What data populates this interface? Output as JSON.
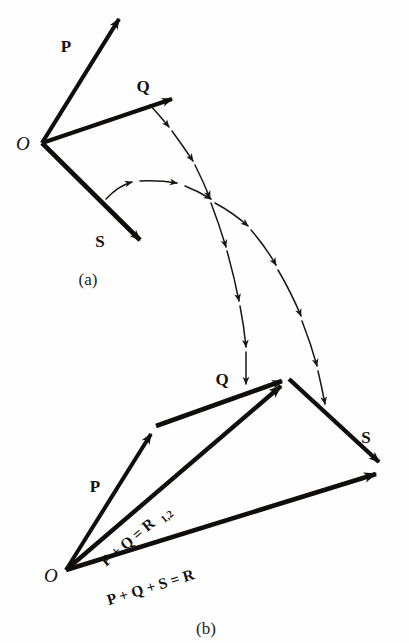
{
  "figure": {
    "background_color": "#fefefe",
    "ink_color": "#100d0c",
    "width": 409,
    "height": 643
  },
  "panels": [
    {
      "id": "a",
      "caption": "(a)",
      "caption_pos": {
        "x": 88,
        "y": 285
      },
      "origin_label": "O",
      "origin_label_pos": {
        "x": 16,
        "y": 150
      },
      "origin_point": {
        "x": 42,
        "y": 143
      },
      "vectors": [
        {
          "name": "P",
          "label": "P",
          "label_pos": {
            "x": 66,
            "y": 52
          },
          "from": {
            "x": 42,
            "y": 143
          },
          "to": {
            "x": 124,
            "y": 12
          },
          "width": 4.2
        },
        {
          "name": "Q",
          "label": "Q",
          "label_pos": {
            "x": 143,
            "y": 92
          },
          "from": {
            "x": 42,
            "y": 143
          },
          "to": {
            "x": 180,
            "y": 96
          },
          "width": 4.2
        },
        {
          "name": "S",
          "label": "S",
          "label_pos": {
            "x": 100,
            "y": 247
          },
          "from": {
            "x": 42,
            "y": 143
          },
          "to": {
            "x": 150,
            "y": 250
          },
          "width": 4.6
        }
      ]
    },
    {
      "id": "b",
      "caption": "(b)",
      "caption_pos": {
        "x": 196,
        "y": 634
      },
      "origin_label": "O",
      "origin_label_pos": {
        "x": 44,
        "y": 580
      },
      "origin_point": {
        "x": 66,
        "y": 570
      },
      "vectors": [
        {
          "name": "P",
          "label": "P",
          "label_pos": {
            "x": 95,
            "y": 492
          },
          "from": {
            "x": 66,
            "y": 570
          },
          "to": {
            "x": 156,
            "y": 426
          },
          "width": 4.0
        },
        {
          "name": "Q",
          "label": "Q",
          "label_pos": {
            "x": 222,
            "y": 385
          },
          "from": {
            "x": 156,
            "y": 426
          },
          "to": {
            "x": 289,
            "y": 379
          },
          "width": 4.6
        },
        {
          "name": "S",
          "label": "S",
          "label_pos": {
            "x": 366,
            "y": 443
          },
          "from": {
            "x": 289,
            "y": 379
          },
          "to": {
            "x": 387,
            "y": 470
          },
          "width": 4.4
        },
        {
          "name": "R12",
          "label": "P + Q = R",
          "label_subscript": "1,2",
          "label_pos": {
            "x": 131,
            "y": 546
          },
          "label_rotation": -24,
          "from": {
            "x": 66,
            "y": 570
          },
          "to": {
            "x": 289,
            "y": 379
          },
          "width": 4.4
        },
        {
          "name": "R",
          "label": "P + Q + S = R",
          "label_pos": {
            "x": 152,
            "y": 592
          },
          "label_rotation": -17,
          "from": {
            "x": 66,
            "y": 570
          },
          "to": {
            "x": 387,
            "y": 471
          },
          "width": 4.6
        }
      ]
    }
  ],
  "transfer_curves": [
    {
      "name": "q-transfer-curve",
      "description": "dashed curve carrying Q from panel a to panel b",
      "arrow_count": 6
    },
    {
      "name": "s-transfer-curve",
      "description": "dashed curve carrying S from panel a to panel b",
      "arrow_count": 7
    }
  ]
}
